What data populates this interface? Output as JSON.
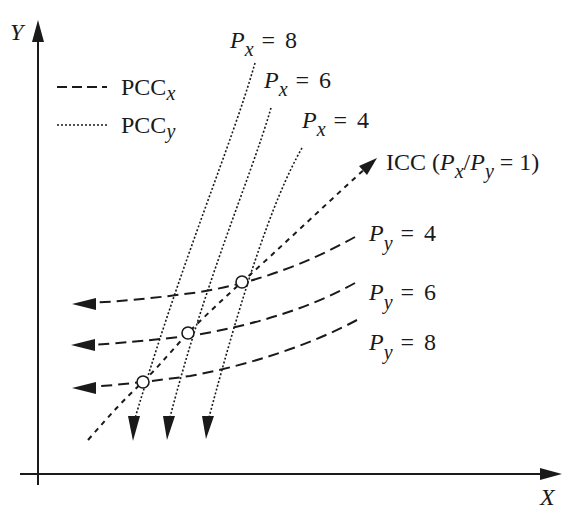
{
  "axes": {
    "x_label": "X",
    "y_label": "Y"
  },
  "legend": {
    "items": [
      {
        "style": "dashed",
        "label": "PCC",
        "subscript": "x"
      },
      {
        "style": "dotted",
        "label": "PCC",
        "subscript": "y"
      }
    ]
  },
  "px_curves": [
    {
      "var": "P",
      "sub": "x",
      "eq": "=",
      "value": "8"
    },
    {
      "var": "P",
      "sub": "x",
      "eq": "=",
      "value": "6"
    },
    {
      "var": "P",
      "sub": "x",
      "eq": "=",
      "value": "4"
    }
  ],
  "py_curves": [
    {
      "var": "P",
      "sub": "y",
      "eq": "=",
      "value": "4"
    },
    {
      "var": "P",
      "sub": "y",
      "eq": "=",
      "value": "6"
    },
    {
      "var": "P",
      "sub": "y",
      "eq": "=",
      "value": "8"
    }
  ],
  "icc": {
    "prefix": "ICC (",
    "p1": "P",
    "sub1": "x",
    "slash": "/",
    "p2": "P",
    "sub2": "y",
    "suffix": " = 1)"
  },
  "colors": {
    "ink": "#1a1a1a",
    "background": "#ffffff"
  }
}
